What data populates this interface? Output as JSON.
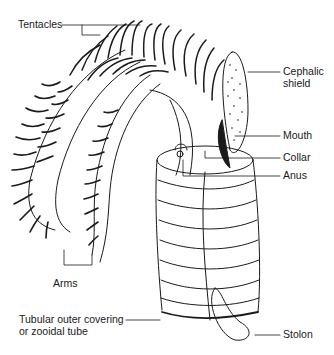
{
  "diagram": {
    "labels": {
      "tentacles": "Tentacles",
      "cephalic_shield_1": "Cephalic",
      "cephalic_shield_2": "shield",
      "mouth": "Mouth",
      "collar": "Collar",
      "anus": "Anus",
      "arms": "Arms",
      "tube_1": "Tubular outer covering",
      "tube_2": "or zooidal tube",
      "stolon": "Stolon"
    },
    "colors": {
      "line": "#1a1a1a",
      "background": "#ffffff"
    }
  }
}
